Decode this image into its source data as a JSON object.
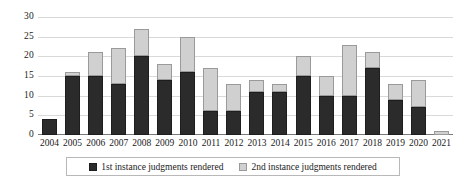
{
  "chart_data": {
    "type": "bar",
    "title": "",
    "subtitle": "",
    "xlabel": "",
    "ylabel": "",
    "stacked": true,
    "grid": true,
    "legend_position": "bottom",
    "ylim": [
      0,
      30
    ],
    "yticks": [
      0,
      5,
      10,
      15,
      20,
      25,
      30
    ],
    "ytick_labels": [
      "0",
      "5",
      "10",
      "15",
      "20",
      "25",
      "30"
    ],
    "categories": [
      "2004",
      "2005",
      "2006",
      "2007",
      "2008",
      "2009",
      "2010",
      "2011",
      "2012",
      "2013",
      "2014",
      "2015",
      "2016",
      "2017",
      "2018",
      "2019",
      "2020",
      "2021"
    ],
    "series": [
      {
        "name": "1st instance judgments rendered",
        "color": "#2b2b2b",
        "values": [
          4,
          15,
          15,
          13,
          20,
          14,
          16,
          6,
          6,
          11,
          11,
          15,
          10,
          10,
          17,
          9,
          7,
          0
        ]
      },
      {
        "name": "2nd instance judgments rendered",
        "color": "#d0d0d0",
        "values": [
          0,
          1,
          6,
          9,
          7,
          4,
          9,
          11,
          7,
          3,
          2,
          5,
          5,
          13,
          4,
          4,
          7,
          1
        ]
      }
    ],
    "totals": [
      4,
      16,
      21,
      22,
      27,
      18,
      25,
      17,
      13,
      14,
      13,
      20,
      15,
      23,
      21,
      13,
      14,
      1
    ]
  },
  "legend": {
    "items": [
      {
        "label": "1st instance judgments rendered",
        "swatch": "dark-square-swatch"
      },
      {
        "label": "2nd instance judgments rendered",
        "swatch": "light-square-swatch"
      }
    ]
  },
  "colors": {
    "first_instance": "#2b2b2b",
    "second_instance": "#d0d0d0",
    "gridline": "#d9d9d9",
    "axis": "#7a7a7a",
    "text": "#1a1a1a",
    "background": "#ffffff"
  }
}
